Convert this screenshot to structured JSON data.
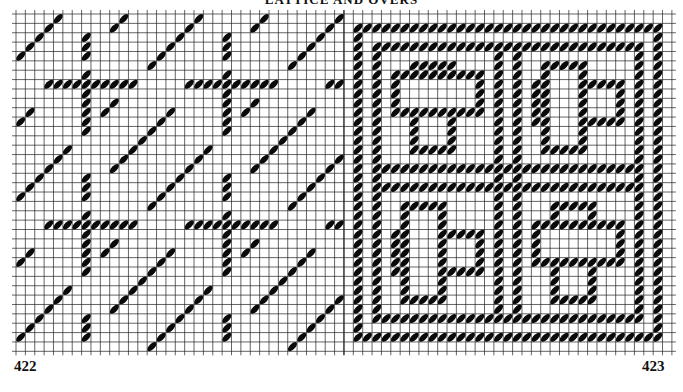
{
  "title": "LATTICE AND OVERS",
  "grid": {
    "x0": 16,
    "y0": 14,
    "cell": 9.37,
    "cols": 70,
    "rows": 36,
    "line_color": "#222222",
    "stitch_color": "#0a0a0a",
    "divider_col": 35
  },
  "charts": [
    {
      "id": "422",
      "label": "422",
      "col_start": 0,
      "col_end": 35,
      "kind": "diagonal-lattice",
      "repeat": 15,
      "bar_rows": [
        7,
        22
      ],
      "bar_cols": [
        7,
        22
      ]
    },
    {
      "id": "423",
      "label": "423",
      "col_start": 35,
      "col_end": 70,
      "kind": "fret-blocks",
      "border_rings": 2,
      "blocks": [
        {
          "quad": "top-left",
          "orientation": "horizontal-bar"
        },
        {
          "quad": "top-right",
          "orientation": "vertical-bar"
        },
        {
          "quad": "bottom-left",
          "orientation": "vertical-bar"
        },
        {
          "quad": "bottom-right",
          "orientation": "horizontal-bar"
        }
      ]
    }
  ]
}
